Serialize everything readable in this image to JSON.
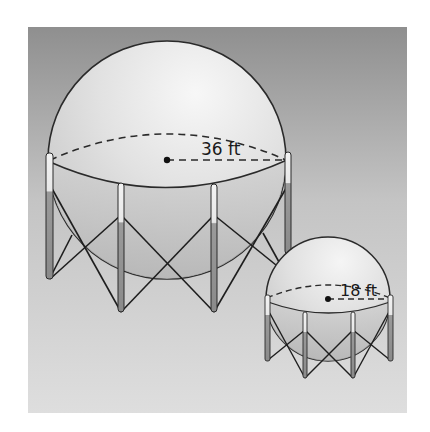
{
  "figure": {
    "large_tank": {
      "label": "36 ft",
      "measure": "radius",
      "value": 36,
      "unit": "ft"
    },
    "small_tank": {
      "label": "18 ft",
      "measure": "radius",
      "value": 18,
      "unit": "ft"
    }
  },
  "colors": {
    "background_top": "#8c8c8c",
    "background_bottom": "#dedede",
    "sphere_light": "#f2f2f2",
    "sphere_shade": "#bdbdbd",
    "outline": "#2a2a2a"
  }
}
